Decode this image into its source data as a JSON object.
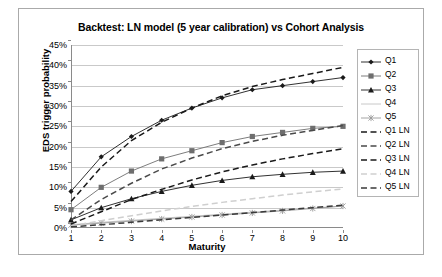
{
  "chart_data": {
    "type": "line",
    "title": "Backtest: LN model (5 year calibration) vs Cohort Analysis",
    "xlabel": "Maturity",
    "ylabel": "EDS trigger probability",
    "x": [
      1,
      2,
      3,
      4,
      5,
      6,
      7,
      8,
      9,
      10
    ],
    "xlim": [
      1,
      10
    ],
    "ylim": [
      0,
      45
    ],
    "ytick_labels": [
      "0%",
      "5%",
      "10%",
      "15%",
      "20%",
      "25%",
      "30%",
      "35%",
      "40%",
      "45%"
    ],
    "ytick_values": [
      0,
      5,
      10,
      15,
      20,
      25,
      30,
      35,
      40,
      45
    ],
    "xtick_labels": [
      "1",
      "2",
      "3",
      "4",
      "5",
      "6",
      "7",
      "8",
      "9",
      "10"
    ],
    "grid": true,
    "legend_position": "right",
    "series": [
      {
        "name": "Q1",
        "marker": "diamond",
        "style": "solid",
        "color": "#1a1a1a",
        "values": [
          9.0,
          17.5,
          22.5,
          26.5,
          29.5,
          32.0,
          34.0,
          35.0,
          36.0,
          37.0
        ]
      },
      {
        "name": "Q2",
        "marker": "square",
        "style": "solid",
        "color": "#6e6e6e",
        "values": [
          4.5,
          10.0,
          14.0,
          17.0,
          19.0,
          21.0,
          22.5,
          23.5,
          24.5,
          25.0
        ]
      },
      {
        "name": "Q3",
        "marker": "triangle",
        "style": "solid",
        "color": "#1a1a1a",
        "values": [
          2.0,
          5.0,
          7.2,
          9.0,
          10.5,
          11.7,
          12.6,
          13.2,
          13.7,
          14.0
        ]
      },
      {
        "name": "Q4",
        "marker": "none",
        "style": "solid",
        "color": "#c2c2c2",
        "values": [
          0.8,
          1.4,
          1.9,
          2.4,
          2.9,
          3.4,
          3.9,
          4.4,
          4.9,
          5.4
        ]
      },
      {
        "name": "Q5",
        "marker": "star",
        "style": "solid",
        "color": "#9a9a9a",
        "values": [
          0.7,
          1.2,
          1.7,
          2.2,
          2.7,
          3.2,
          3.7,
          4.2,
          4.8,
          5.4
        ]
      },
      {
        "name": "Q1 LN",
        "marker": "none",
        "style": "dashed",
        "color": "#1a1a1a",
        "values": [
          6.5,
          15.0,
          21.5,
          26.0,
          29.5,
          32.5,
          34.8,
          36.5,
          38.0,
          39.5
        ]
      },
      {
        "name": "Q2 LN",
        "marker": "none",
        "style": "dashed",
        "color": "#4a4a4a",
        "values": [
          2.0,
          7.0,
          11.0,
          14.5,
          17.2,
          19.5,
          21.3,
          22.8,
          24.0,
          25.2
        ]
      },
      {
        "name": "Q3 LN",
        "marker": "none",
        "style": "dashed",
        "color": "#1a1a1a",
        "values": [
          1.0,
          4.0,
          7.0,
          9.5,
          11.8,
          13.8,
          15.5,
          17.0,
          18.3,
          19.5
        ]
      },
      {
        "name": "Q4 LN",
        "marker": "none",
        "style": "dashed",
        "color": "#cfcfcf",
        "values": [
          0.5,
          1.8,
          3.0,
          4.2,
          5.3,
          6.3,
          7.2,
          8.1,
          8.9,
          9.6
        ]
      },
      {
        "name": "Q5 LN",
        "marker": "none",
        "style": "dashed",
        "color": "#3a3a3a",
        "values": [
          0.3,
          0.8,
          1.4,
          2.0,
          2.6,
          3.2,
          3.8,
          4.4,
          5.0,
          5.6
        ]
      }
    ]
  }
}
